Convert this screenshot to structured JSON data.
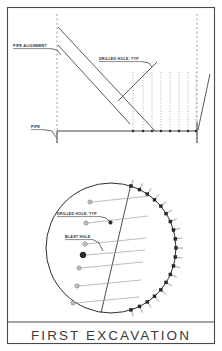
{
  "sheet": {
    "title": "FIRST EXCAVATION",
    "border_color": "#4a4a4a",
    "background": "#ffffff"
  },
  "elevation_view": {
    "name": "elevation-section",
    "annotations": [
      {
        "id": "pipe-alignment",
        "label": "PIPE ALIGNMENT",
        "x": 13,
        "y": 47
      },
      {
        "id": "drilled-hole-typ",
        "label": "DRILLED HOLE, TYP",
        "x": 99,
        "y": 60
      },
      {
        "id": "pipe",
        "label": "PIPE",
        "x": 31,
        "y": 128
      }
    ],
    "floor_line": {
      "x1": 57,
      "y1": 131,
      "x2": 197,
      "y2": 131
    },
    "left_dashed_vertical": {
      "x": 57,
      "y1": 14,
      "y2": 143
    },
    "right_dashed_vertical": {
      "x": 197,
      "y1": 14,
      "y2": 143
    },
    "diagonals": [
      {
        "x1": 58,
        "y1": 27,
        "x2": 155,
        "y2": 131
      },
      {
        "x1": 58,
        "y1": 45,
        "x2": 130,
        "y2": 124
      }
    ],
    "leader_diagonal": {
      "x1": 118,
      "y1": 101,
      "x2": 157,
      "y2": 62
    },
    "right_edge_diagonal": {
      "x1": 210,
      "y1": 74,
      "x2": 198,
      "y2": 130
    },
    "drilled_holes_x": [
      133,
      143,
      152,
      161,
      170,
      179,
      188,
      196
    ],
    "drilled_hole_top_y": 72,
    "drilled_hole_bottom_y": 131
  },
  "section_view": {
    "name": "circular-section",
    "center_x": 111,
    "center_y": 248,
    "radius": 65,
    "chord": {
      "x1": 131,
      "y1": 184,
      "x2": 101,
      "y2": 313
    },
    "annotations": [
      {
        "id": "drilled-hole-typ",
        "label": "DRILLED HOLE, TYP",
        "x": 57,
        "y": 215
      },
      {
        "id": "blast-hole",
        "label": "BLAST HOLE",
        "x": 65,
        "y": 238
      }
    ],
    "interior_holes": [
      {
        "cx": 90,
        "cy": 202,
        "r": 2.0,
        "type": "ring",
        "leader_to_x": 150
      },
      {
        "cx": 86,
        "cy": 223,
        "r": 2.0,
        "type": "ring",
        "leader_to_x": 148
      },
      {
        "cx": 85,
        "cy": 244,
        "r": 2.2,
        "type": "ring",
        "leader_to_x": 146
      },
      {
        "cx": 83,
        "cy": 255,
        "r": 2.8,
        "type": "blast",
        "leader_to_x": 145
      },
      {
        "cx": 79,
        "cy": 268,
        "r": 2.0,
        "type": "ring",
        "leader_to_x": 143
      },
      {
        "cx": 77,
        "cy": 286,
        "r": 2.0,
        "type": "ring",
        "leader_to_x": 141
      },
      {
        "cx": 73,
        "cy": 303,
        "r": 2.0,
        "type": "ring",
        "leader_to_x": 139
      }
    ],
    "arc_marker_count": 19,
    "arc_start_angle_deg": -72,
    "arc_end_angle_deg": 72,
    "arc_tick_length": 7
  }
}
